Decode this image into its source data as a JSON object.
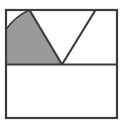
{
  "figure": {
    "title": "Square with inscribed triangle and shaded circular sector",
    "type": "geometric-diagram",
    "canvas": {
      "width": 127,
      "height": 124
    },
    "colors": {
      "background": "#ffffff",
      "stroke": "#3d3d3d",
      "shaded_fill": "#9a9a9a",
      "unshaded_fill": "#ffffff"
    },
    "stroke_width": 2.2,
    "shapes": {
      "outer_square": {
        "name": "outer-square",
        "x": 6,
        "y": 10,
        "width": 111,
        "height": 108,
        "label": "Outer square"
      },
      "midline": {
        "name": "horizontal-midline",
        "x1": 6,
        "y1": 64.5,
        "x2": 117,
        "y2": 64.5,
        "label": "Horizontal midline dividing square into two halves"
      },
      "triangle": {
        "name": "inscribed-triangle",
        "apex": {
          "x": 62,
          "y": 64.5
        },
        "left_top": {
          "x": 29.5,
          "y": 10
        },
        "right_top": {
          "x": 95.5,
          "y": 10
        },
        "label": "V-shaped triangle with apex on midline"
      },
      "sector": {
        "name": "shaded-sector",
        "center": {
          "x": 62,
          "y": 64.5
        },
        "radius": 56,
        "arc_start": {
          "x": 29.5,
          "y": 10
        },
        "arc_end": {
          "x": 6,
          "y": 29.5
        },
        "corner": {
          "x": 6,
          "y": 64.5
        },
        "label": "Shaded circular sector bounded by left triangle leg, arc, left edge and midline"
      }
    }
  }
}
